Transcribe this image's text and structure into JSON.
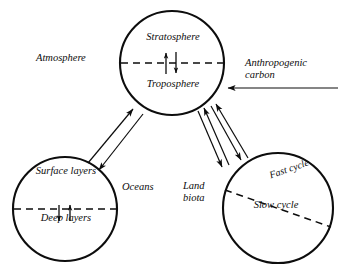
{
  "diagram": {
    "background_color": "#ffffff",
    "stroke_color": "#0d0d0d",
    "labels": {
      "atmosphere": "Atmosphere",
      "stratosphere": "Stratosphere",
      "troposphere": "Troposphere",
      "anthropogenic_carbon": "Anthropogenic carbon",
      "oceans": "Oceans",
      "surface_layers": "Surface layers",
      "deep_layers": "Deep layers",
      "land_biota": "Land biota",
      "fast_cycle": "Fast cycle",
      "slow_cycle": "Slow cycle"
    },
    "nodes": [
      {
        "name": "atmosphere",
        "label": "Atmosphere",
        "cx": 172,
        "cy": 63,
        "r": 52,
        "divider": "horizontal-dashed",
        "upper_compartment": "Stratosphere",
        "lower_compartment": "Troposphere",
        "internal_arrows": [
          "up",
          "down"
        ]
      },
      {
        "name": "oceans",
        "label": "Oceans",
        "cx": 65,
        "cy": 209,
        "r": 52,
        "divider": "horizontal-dashed",
        "upper_compartment": "Surface layers",
        "lower_compartment": "Deep layers",
        "internal_arrows": [
          "down",
          "up"
        ]
      },
      {
        "name": "land-biota",
        "label": "Land biota",
        "cx": 278,
        "cy": 208,
        "r": 55,
        "divider": "diagonal-dashed",
        "upper_compartment": "Fast cycle",
        "lower_compartment": "Slow cycle",
        "internal_arrows": []
      }
    ],
    "flows": [
      {
        "name": "oceans-to-atmosphere",
        "from": "oceans",
        "to": "atmosphere",
        "direction": "up-right"
      },
      {
        "name": "atmosphere-to-oceans",
        "from": "atmosphere",
        "to": "oceans",
        "direction": "down-left"
      },
      {
        "name": "land-biota-to-atmosphere-outer",
        "from": "land-biota",
        "to": "atmosphere",
        "direction": "up-left"
      },
      {
        "name": "land-biota-to-atmosphere-inner",
        "from": "land-biota",
        "to": "atmosphere",
        "direction": "up-left"
      },
      {
        "name": "atmosphere-to-land-biota-inner",
        "from": "atmosphere",
        "to": "land-biota",
        "direction": "down-right"
      },
      {
        "name": "atmosphere-to-land-biota-outer",
        "from": "atmosphere",
        "to": "land-biota",
        "direction": "down-right"
      },
      {
        "name": "anthropogenic-carbon-input",
        "from": "external",
        "to": "atmosphere",
        "direction": "left"
      }
    ]
  }
}
